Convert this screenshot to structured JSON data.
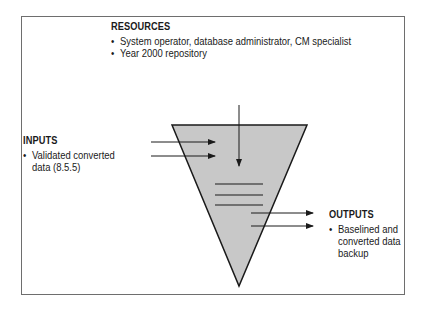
{
  "diagram": {
    "type": "process-funnel",
    "colors": {
      "frame": "#6e6e6e",
      "funnel_fill": "#c8c8c8",
      "stroke": "#1a1a1a",
      "background": "#ffffff"
    },
    "resources": {
      "heading": "RESOURCES",
      "items": [
        "System operator, database administrator, CM specialist",
        "Year 2000 repository"
      ]
    },
    "inputs": {
      "heading": "INPUTS",
      "items": [
        "Validated converted\ndata (8.5.5)"
      ]
    },
    "outputs": {
      "heading": "OUTPUTS",
      "items": [
        "Baselined and\nconverted data\nbackup"
      ]
    }
  }
}
